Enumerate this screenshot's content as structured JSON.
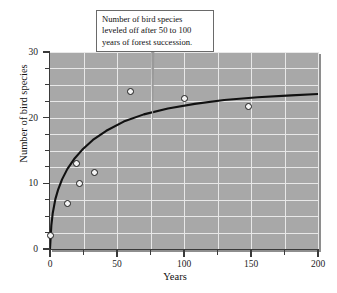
{
  "chart_data": {
    "type": "scatter",
    "title": "",
    "xlabel": "Years",
    "ylabel": "Number of bird species",
    "xlim": [
      0,
      200
    ],
    "ylim": [
      0,
      30
    ],
    "xticks": [
      0,
      50,
      100,
      150,
      200
    ],
    "yticks": [
      0,
      10,
      20,
      30
    ],
    "xtick_labels": [
      "0",
      "50",
      "100",
      "150",
      "200"
    ],
    "ytick_labels": [
      "0",
      "10",
      "20",
      "30"
    ],
    "x_minor_interval": 25,
    "y_minor_interval": 2.5,
    "grid": true,
    "grid_color": "#e8e8e8",
    "plot_background": "#a8a8a8",
    "legend": null,
    "points": [
      {
        "x": 0,
        "y": 2.0
      },
      {
        "x": 13,
        "y": 7.0
      },
      {
        "x": 20,
        "y": 13.0
      },
      {
        "x": 22,
        "y": 10.0
      },
      {
        "x": 33,
        "y": 11.7
      },
      {
        "x": 60,
        "y": 24.0
      },
      {
        "x": 100,
        "y": 23.0
      },
      {
        "x": 148,
        "y": 21.7
      }
    ],
    "series": [
      {
        "name": "fitted logarithmic curve",
        "type": "line",
        "color": "#111111",
        "x": [
          0,
          1,
          2,
          4,
          6,
          9,
          13,
          18,
          24,
          32,
          42,
          55,
          70,
          88,
          108,
          130,
          155,
          180,
          200
        ],
        "y": [
          0.0,
          3.6,
          5.4,
          7.6,
          9.0,
          10.6,
          12.2,
          13.7,
          15.1,
          16.6,
          18.0,
          19.4,
          20.5,
          21.4,
          22.1,
          22.7,
          23.1,
          23.4,
          23.6
        ]
      }
    ],
    "annotations": [
      {
        "name": "leveled-off-callout",
        "lines": [
          "Number of bird species",
          "leveled off after 50 to 100",
          "years of forest succession."
        ],
        "points_to": {
          "x": 78,
          "y": 19.5
        }
      }
    ]
  }
}
